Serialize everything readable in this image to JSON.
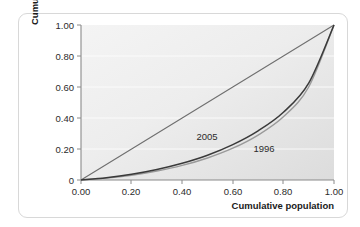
{
  "chart_data": {
    "type": "line",
    "title": "",
    "xlabel": "Cumulative population",
    "ylabel": "Cumulative income",
    "xlim": [
      0.0,
      1.0
    ],
    "ylim": [
      0.0,
      1.0
    ],
    "grid": true,
    "legend_position": "inline-annotations",
    "xticklabels": [
      "0.00",
      "0.20",
      "0.40",
      "0.60",
      "0.80",
      "1.00"
    ],
    "xtickvalues": [
      0.0,
      0.2,
      0.4,
      0.6,
      0.8,
      1.0
    ],
    "yticklabels": [
      "0",
      "0.20",
      "0.40",
      "0.60",
      "0.80",
      "1.00"
    ],
    "ytickvalues": [
      0.0,
      0.2,
      0.4,
      0.6,
      0.8,
      1.0
    ],
    "x": [
      0.0,
      0.1,
      0.2,
      0.3,
      0.4,
      0.5,
      0.6,
      0.7,
      0.8,
      0.9,
      1.0
    ],
    "series": [
      {
        "name": "equality-line",
        "label": "",
        "color": "#6f6f6f",
        "values": [
          0.0,
          0.1,
          0.2,
          0.3,
          0.4,
          0.5,
          0.6,
          0.7,
          0.8,
          0.9,
          1.0
        ]
      },
      {
        "name": "2005",
        "label": "2005",
        "color": "#3a3a3a",
        "values": [
          0.0,
          0.015,
          0.037,
          0.068,
          0.108,
          0.16,
          0.228,
          0.317,
          0.437,
          0.625,
          1.0
        ]
      },
      {
        "name": "1996",
        "label": "1996",
        "color": "#9a9a9a",
        "values": [
          0.0,
          0.012,
          0.031,
          0.058,
          0.094,
          0.142,
          0.205,
          0.29,
          0.408,
          0.6,
          1.0
        ]
      }
    ],
    "annotations": [
      {
        "text": "2005",
        "x": 0.6,
        "y": 0.295
      },
      {
        "text": "1996",
        "x": 0.755,
        "y": 0.225
      }
    ],
    "colors": {
      "plot_background_light": "#f2f2f2",
      "plot_background_dark": "#d9d9d9",
      "gridline": "#ffffff",
      "axis": "#808080",
      "card_border": "#d8d8d8",
      "text": "#2b2b2b"
    }
  }
}
